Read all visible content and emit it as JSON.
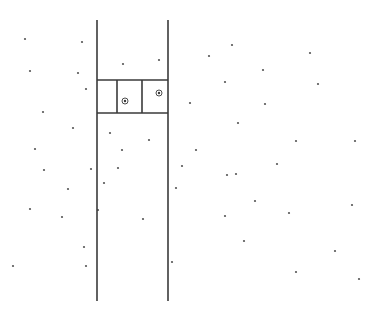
{
  "diagram": {
    "width": 372,
    "height": 319,
    "background": "#ffffff",
    "line_color": "#3a3a3a",
    "dot_color": "#555555",
    "rails": [
      {
        "x": 97,
        "y1": 20,
        "y2": 301
      },
      {
        "x": 168,
        "y1": 20,
        "y2": 301
      }
    ],
    "cell_block": {
      "x1": 97,
      "x2": 168,
      "y_top": 80,
      "y_bottom": 113,
      "dividers_x": [
        117,
        142
      ]
    },
    "markers": [
      {
        "x": 125,
        "y": 101,
        "r": 3
      },
      {
        "x": 159,
        "y": 93,
        "r": 3
      }
    ],
    "dots": [
      [
        25,
        39
      ],
      [
        82,
        42
      ],
      [
        30,
        71
      ],
      [
        78,
        73
      ],
      [
        86,
        89
      ],
      [
        43,
        112
      ],
      [
        73,
        128
      ],
      [
        35,
        149
      ],
      [
        123,
        64
      ],
      [
        159,
        60
      ],
      [
        110,
        133
      ],
      [
        149,
        140
      ],
      [
        122,
        150
      ],
      [
        232,
        45
      ],
      [
        209,
        56
      ],
      [
        310,
        53
      ],
      [
        263,
        70
      ],
      [
        225,
        82
      ],
      [
        318,
        84
      ],
      [
        190,
        103
      ],
      [
        265,
        104
      ],
      [
        238,
        123
      ],
      [
        196,
        150
      ],
      [
        296,
        141
      ],
      [
        355,
        141
      ],
      [
        44,
        170
      ],
      [
        68,
        189
      ],
      [
        30,
        209
      ],
      [
        62,
        217
      ],
      [
        84,
        247
      ],
      [
        86,
        266
      ],
      [
        13,
        266
      ],
      [
        91,
        169
      ],
      [
        104,
        183
      ],
      [
        98,
        210
      ],
      [
        118,
        168
      ],
      [
        143,
        219
      ],
      [
        176,
        188
      ],
      [
        172,
        262
      ],
      [
        182,
        166
      ],
      [
        227,
        175
      ],
      [
        277,
        164
      ],
      [
        236,
        174
      ],
      [
        255,
        201
      ],
      [
        225,
        216
      ],
      [
        289,
        213
      ],
      [
        352,
        205
      ],
      [
        244,
        241
      ],
      [
        335,
        251
      ],
      [
        296,
        272
      ],
      [
        359,
        279
      ]
    ]
  }
}
